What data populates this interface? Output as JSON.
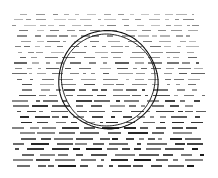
{
  "figure": {
    "name": "scanned-texture-with-circle",
    "width": 218,
    "height": 178,
    "background_color": "#ffffff",
    "ink_color": "#1a1a1a",
    "caption": ""
  },
  "texture": {
    "name": "dashed-line-field",
    "pattern_type": "horizontal-dashed-rows",
    "margin_left": 12,
    "margin_right": 10,
    "margin_top": 9,
    "margin_bottom": 8,
    "row_count": 30,
    "row_spacing": 5.4,
    "dash_min_length": 3,
    "dash_max_length": 22,
    "dash_gap_min": 2,
    "dash_gap_max": 9,
    "dash_height_top": 0.9,
    "dash_height_bottom": 2.0,
    "opacity_top": 0.42,
    "opacity_bottom": 0.95,
    "seed": 20240517
  },
  "annotation": {
    "name": "circle-annotation",
    "shape": "circle",
    "stroke_style": "double-concentric",
    "center_x": 108,
    "center_y": 80,
    "radius_outer": 49.5,
    "radius_inner": 46.5,
    "stroke_color": "#111111",
    "stroke_width": 1.1,
    "wobble": 1.2
  }
}
